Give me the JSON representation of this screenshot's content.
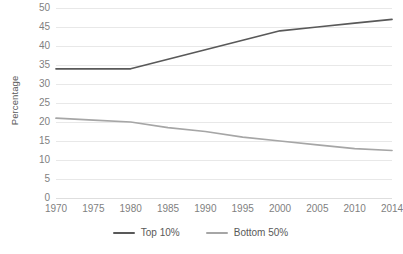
{
  "chart_data": {
    "type": "line",
    "title": "",
    "subtitle": "",
    "xlabel": "",
    "ylabel": "Percentage",
    "categories": [
      "1970",
      "1975",
      "1980",
      "1985",
      "1990",
      "1995",
      "2000",
      "2005",
      "2010",
      "2014"
    ],
    "x": [
      1970,
      1975,
      1980,
      1985,
      1990,
      1995,
      2000,
      2005,
      2010,
      2014
    ],
    "series": [
      {
        "name": "Top 10%",
        "color": "#595959",
        "values": [
          34,
          34,
          34,
          36.5,
          39,
          41.5,
          44,
          45,
          46,
          47
        ]
      },
      {
        "name": "Bottom 50%",
        "color": "#a6a6a6",
        "values": [
          21,
          20.5,
          20,
          18.5,
          17.5,
          16,
          15,
          14,
          13,
          12.5
        ]
      }
    ],
    "ylim": [
      0,
      50
    ],
    "y_ticks": [
      0,
      5,
      10,
      15,
      20,
      25,
      30,
      35,
      40,
      45,
      50
    ],
    "y_tick_labels": [
      "0",
      "5",
      "10",
      "15",
      "20",
      "25",
      "30",
      "35",
      "40",
      "45",
      "50"
    ],
    "grid": "horizontal",
    "legend_position": "bottom",
    "legend": [
      "Top 10%",
      "Bottom 50%"
    ]
  },
  "axes": {
    "y_title": "Percentage"
  },
  "legend": {
    "items": [
      {
        "label": "Top 10%",
        "color": "#595959"
      },
      {
        "label": "Bottom 50%",
        "color": "#a6a6a6"
      }
    ]
  }
}
